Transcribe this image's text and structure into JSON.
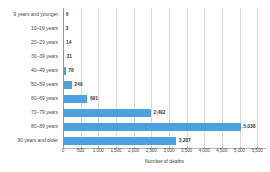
{
  "chart_data": {
    "type": "bar",
    "orientation": "horizontal",
    "title": "",
    "subtitle": "",
    "xlabel": "Number of deaths",
    "ylabel": "",
    "categories": [
      "9 years and younger",
      "10–19 years",
      "20–29 years",
      "30–39 years",
      "40–49 years",
      "50–59 years",
      "60–69 years",
      "70–79 years",
      "80–89 years",
      "90 years and older"
    ],
    "values": [
      6,
      3,
      14,
      31,
      78,
      249,
      691,
      2492,
      5038,
      3207
    ],
    "value_labels": [
      "6",
      "3",
      "14",
      "31",
      "78",
      "249",
      "691",
      "2,492",
      "5,038",
      "3,207"
    ],
    "xlim": [
      0,
      5750
    ],
    "xticks": [
      0,
      500,
      1000,
      1500,
      2000,
      2500,
      3000,
      3500,
      4000,
      4500,
      5000,
      5500
    ],
    "xtick_labels": [
      "0",
      "500",
      "1,000",
      "1,500",
      "2,000",
      "2,500",
      "3,000",
      "3,500",
      "4,000",
      "4,500",
      "5,000",
      "5,500"
    ],
    "grid": "vertical",
    "legend": "none",
    "bar_color": "#4da2dd",
    "gridline_color": "#d9d9d9",
    "axis_color": "#b5b5b5",
    "text_color": "#4a4a4a"
  }
}
